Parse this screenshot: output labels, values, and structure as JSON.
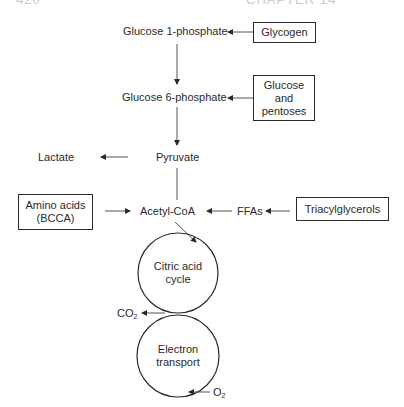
{
  "header": {
    "page_number": "420",
    "chapter": "CHAPTER 14"
  },
  "nodes": {
    "glucose_1_phosphate": "Glucose 1-phosphate",
    "glucose_6_phosphate": "Glucose 6-phosphate",
    "pyruvate": "Pyruvate",
    "lactate": "Lactate",
    "acetyl_coa": "Acetyl-CoA",
    "ffas": "FFAs",
    "co2": "CO",
    "co2_sub": "2",
    "o2": "O",
    "o2_sub": "2"
  },
  "boxes": {
    "glycogen": "Glycogen",
    "glucose_pentoses_1": "Glucose",
    "glucose_pentoses_2": "and",
    "glucose_pentoses_3": "pentoses",
    "amino_acids_1": "Amino acids",
    "amino_acids_2": "(BCCA)",
    "triacylglycerols": "Triacylglycerols"
  },
  "cycles": {
    "citric_acid_1": "Citric acid",
    "citric_acid_2": "cycle",
    "electron_1": "Electron",
    "electron_2": "transport"
  },
  "edges": [
    {
      "from": "Glycogen",
      "to": "Glucose 1-phosphate"
    },
    {
      "from": "Glucose 1-phosphate",
      "to": "Glucose 6-phosphate"
    },
    {
      "from": "Glucose and pentoses",
      "to": "Glucose 6-phosphate"
    },
    {
      "from": "Glucose 6-phosphate",
      "to": "Pyruvate"
    },
    {
      "from": "Pyruvate",
      "to": "Lactate"
    },
    {
      "from": "Pyruvate",
      "to": "Acetyl-CoA"
    },
    {
      "from": "Amino acids (BCCA)",
      "to": "Acetyl-CoA"
    },
    {
      "from": "FFAs",
      "to": "Acetyl-CoA"
    },
    {
      "from": "Triacylglycerols",
      "to": "FFAs"
    },
    {
      "from": "Acetyl-CoA",
      "to": "Citric acid cycle"
    },
    {
      "from": "Citric acid cycle",
      "to": "CO2"
    },
    {
      "from": "O2",
      "to": "Electron transport"
    }
  ],
  "colors": {
    "ink": "#2a2a2a",
    "background": "#ffffff"
  }
}
